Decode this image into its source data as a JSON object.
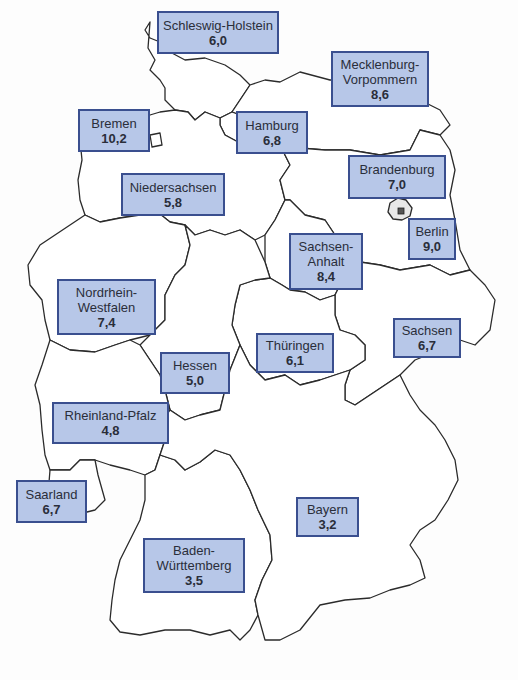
{
  "map": {
    "region": "Deutschland",
    "label_fill": "#b7c7e8",
    "label_border": "#3a4f8f",
    "states": [
      {
        "id": "schleswig-holstein",
        "name": "Schleswig-Holstein",
        "value": "6,0"
      },
      {
        "id": "mecklenburg-vorpommern",
        "name": "Mecklenburg-Vorpommern",
        "name_lines": [
          "Mecklenburg-",
          "Vorpommern"
        ],
        "value": "8,6"
      },
      {
        "id": "bremen",
        "name": "Bremen",
        "value": "10,2"
      },
      {
        "id": "hamburg",
        "name": "Hamburg",
        "value": "6,8"
      },
      {
        "id": "brandenburg",
        "name": "Brandenburg",
        "value": "7,0"
      },
      {
        "id": "niedersachsen",
        "name": "Niedersachsen",
        "value": "5,8"
      },
      {
        "id": "berlin",
        "name": "Berlin",
        "value": "9,0"
      },
      {
        "id": "sachsen-anhalt",
        "name": "Sachsen-Anhalt",
        "name_lines": [
          "Sachsen-",
          "Anhalt"
        ],
        "value": "8,4"
      },
      {
        "id": "nordrhein-westfalen",
        "name": "Nordrhein-Westfalen",
        "name_lines": [
          "Nordrhein-",
          "Westfalen"
        ],
        "value": "7,4"
      },
      {
        "id": "sachsen",
        "name": "Sachsen",
        "value": "6,7"
      },
      {
        "id": "thueringen",
        "name": "Thüringen",
        "value": "6,1"
      },
      {
        "id": "hessen",
        "name": "Hessen",
        "value": "5,0"
      },
      {
        "id": "rheinland-pfalz",
        "name": "Rheinland-Pfalz",
        "value": "4,8"
      },
      {
        "id": "saarland",
        "name": "Saarland",
        "value": "6,7"
      },
      {
        "id": "bayern",
        "name": "Bayern",
        "value": "3,2"
      },
      {
        "id": "baden-wuerttemberg",
        "name": "Baden-Württemberg",
        "name_lines": [
          "Baden-",
          "Württemberg"
        ],
        "value": "3,5"
      }
    ]
  }
}
